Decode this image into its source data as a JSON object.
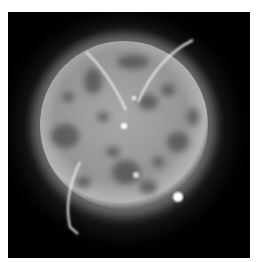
{
  "image": {
    "description": "Grayscale image of a glowing textured sphere with mottled dark patches, bright arcing filaments and several bright point spots against a black background",
    "colors": {
      "background": "#000000",
      "sphere": "#9a9a9a",
      "glow": "#c8c8c8",
      "patches": "#4a4a4a",
      "filaments": "#e6e6e6",
      "spots": "#ffffff"
    }
  }
}
